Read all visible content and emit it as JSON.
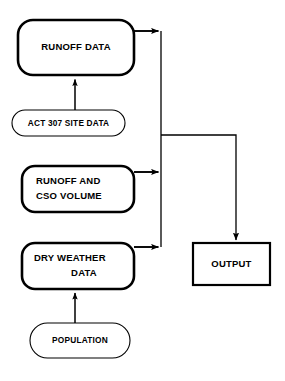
{
  "diagram": {
    "background_color": "#ffffff",
    "stroke_color": "#000000",
    "nodes": [
      {
        "id": "runoff-data",
        "label": "RUNOFF DATA",
        "lines": [
          "RUNOFF DATA"
        ],
        "shape": "rounded-rectangle",
        "stroke_weight": "thick",
        "x": 18,
        "y": 20,
        "w": 116,
        "h": 55
      },
      {
        "id": "act-307-site-data",
        "label": "ACT 307 SITE DATA",
        "lines": [
          "ACT 307 SITE DATA"
        ],
        "shape": "stadium",
        "stroke_weight": "thin",
        "x": 12,
        "y": 110,
        "w": 113,
        "h": 26
      },
      {
        "id": "runoff-and-cso-volume",
        "label": "RUNOFF AND CSO VOLUME",
        "lines": [
          "RUNOFF AND",
          "CSO VOLUME"
        ],
        "shape": "rounded-rectangle",
        "stroke_weight": "thick",
        "x": 22,
        "y": 166,
        "w": 112,
        "h": 46
      },
      {
        "id": "dry-weather-data",
        "label": "DRY WEATHER DATA",
        "lines": [
          "DRY WEATHER",
          "DATA"
        ],
        "shape": "rounded-rectangle",
        "stroke_weight": "thick",
        "x": 22,
        "y": 243,
        "w": 112,
        "h": 46
      },
      {
        "id": "population",
        "label": "POPULATION",
        "lines": [
          "POPULATION"
        ],
        "shape": "stadium",
        "stroke_weight": "thin",
        "x": 30,
        "y": 323,
        "w": 100,
        "h": 35
      },
      {
        "id": "output",
        "label": "OUTPUT",
        "lines": [
          "OUTPUT"
        ],
        "shape": "rectangle",
        "stroke_weight": "thick",
        "x": 193,
        "y": 243,
        "w": 77,
        "h": 42
      }
    ],
    "connections": [
      {
        "id": "act307-to-runoff-data",
        "from": "act-307-site-data",
        "to": "runoff-data",
        "direction": "up",
        "arrowhead": true
      },
      {
        "id": "population-to-dry-weather",
        "from": "population",
        "to": "dry-weather-data",
        "direction": "up",
        "arrowhead": true
      },
      {
        "id": "runoff-data-to-bus",
        "from": "runoff-data",
        "to": "collector-bus",
        "direction": "right",
        "arrowhead": true
      },
      {
        "id": "cso-volume-to-bus",
        "from": "runoff-and-cso-volume",
        "to": "collector-bus",
        "direction": "right",
        "arrowhead": true
      },
      {
        "id": "dry-weather-to-bus",
        "from": "dry-weather-data",
        "to": "collector-bus",
        "direction": "right",
        "arrowhead": true
      },
      {
        "id": "bus-to-output",
        "from": "collector-bus",
        "to": "output",
        "direction": "right-then-down",
        "arrowhead": true
      }
    ],
    "collector_bus": {
      "id": "collector-bus",
      "x": 161,
      "y_top": 31,
      "y_bottom": 247
    }
  }
}
